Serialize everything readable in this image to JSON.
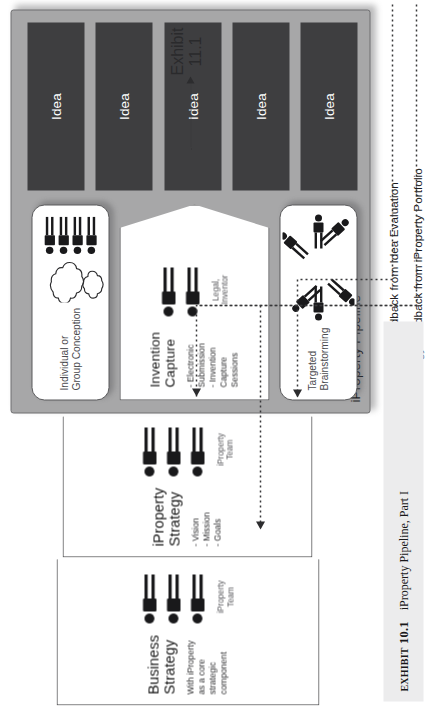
{
  "figure": {
    "caption_number_prefix": "Exhibit",
    "caption_number": "10.1",
    "caption_text": "iProperty Pipeline, Part I"
  },
  "exhibit_ref": {
    "line1": "Exhibit",
    "line2": "11.1"
  },
  "stages": {
    "business_strategy": {
      "title_line1": "Business",
      "title_line2": "Strategy",
      "body_line1": "With iProperty",
      "body_line2": "as a core",
      "body_line3": "strategic",
      "body_line4": "component",
      "people_caption_line1": "iProperty",
      "people_caption_line2": "Team",
      "people_count": 3
    },
    "iproperty_strategy": {
      "title_line1": "iProperty",
      "title_line2": "Strategy",
      "bullet1": "- Vision",
      "bullet2": "- Mission",
      "bullet3": "- Goals",
      "people_caption_line1": "iProperty",
      "people_caption_line2": "Team",
      "people_count": 3
    }
  },
  "pipeline": {
    "label": "iProperty Pipeline",
    "conception": {
      "title_line1": "Individual or",
      "title_line2": "Group Conception",
      "people_count": 4,
      "cloud_count": 2
    },
    "brainstorming": {
      "title_line1": "Targeted",
      "title_line2": "Brainstorming",
      "people_count": 6
    },
    "invention_capture": {
      "title_line1": "Invention",
      "title_line2": "Capture",
      "bullet1": "- Electronic",
      "bullet2": "Submission",
      "bullet3": "- Invention",
      "bullet4": "Capture",
      "bullet5": "Sessions",
      "people_caption_line1": "Legal,",
      "people_caption_line2": "Inventor",
      "people_count": 2
    },
    "ideas": [
      {
        "label": "Idea"
      },
      {
        "label": "Idea"
      },
      {
        "label": "Idea"
      },
      {
        "label": "Idea"
      },
      {
        "label": "Idea"
      }
    ]
  },
  "feedback": {
    "inventor_feedback": "Inventor Feedback from Idea Evaluation",
    "strategy_feedback": "Strategy Feedback from iProperty Portfolio"
  },
  "colors": {
    "panel_fill": "#a7a7a8",
    "idea_fill": "#3e3e40",
    "idea_text": "#ffffff",
    "box_fill": "#ffffff",
    "box_stroke": "#4b4b4d",
    "caption_strip": "#ececed",
    "connector": "#38383a"
  }
}
